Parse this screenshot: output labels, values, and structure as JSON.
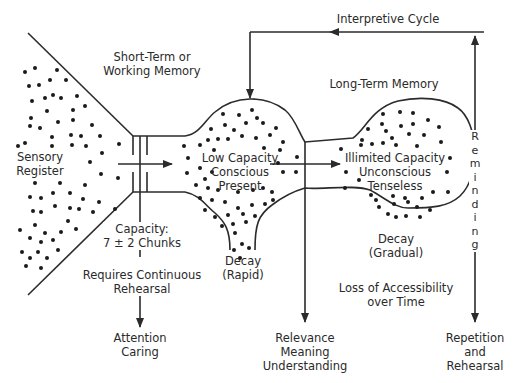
{
  "diagram": {
    "labels": {
      "interpretive_cycle": "Interpretive Cycle",
      "short_term": [
        "Short-Term or",
        "Working Memory"
      ],
      "long_term": "Long-Term Memory",
      "sensory": [
        "Sensory",
        "Register"
      ],
      "stm_core": [
        "Low Capacity",
        "Conscious",
        "Present"
      ],
      "ltm_core": [
        "Illimited Capacity",
        "Unconscious",
        "Tenseless"
      ],
      "capacity": [
        "Capacity:",
        "7 ± 2 Chunks"
      ],
      "requires": [
        "Requires Continuous",
        "Rehearsal"
      ],
      "attention": [
        "Attention",
        "Caring"
      ],
      "decay_rapid": [
        "Decay",
        "(Rapid)"
      ],
      "decay_gradual": [
        "Decay",
        "(Gradual)"
      ],
      "loss": [
        "Loss of Accessibility",
        "over Time"
      ],
      "relevance": [
        "Relevance",
        "Meaning",
        "Understanding"
      ],
      "repetition": [
        "Repetition",
        "and",
        "Rehearsal"
      ],
      "reminding": [
        "R",
        "e",
        "m",
        "i",
        "n",
        "d",
        "i",
        "n",
        "g"
      ]
    },
    "colors": {
      "line": "#2b2b2b",
      "dot": "#1a1a1a",
      "background": "#ffffff"
    }
  }
}
